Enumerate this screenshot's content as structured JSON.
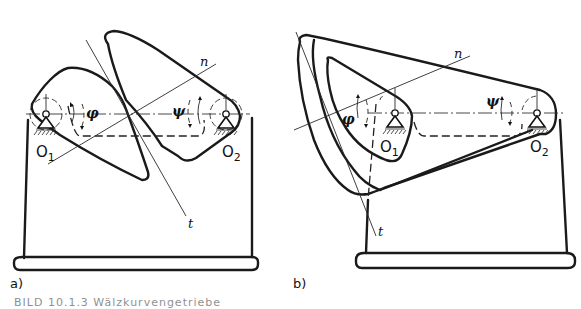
{
  "figure": {
    "panels": [
      {
        "id": "a",
        "label": "a)",
        "pivot_left": "O",
        "pivot_left_sub": "1",
        "pivot_right": "O",
        "pivot_right_sub": "2",
        "angle_left": "φ",
        "angle_right": "ψ",
        "normal_label": "n",
        "tangent_label": "t"
      },
      {
        "id": "b",
        "label": "b)",
        "pivot_left": "O",
        "pivot_left_sub": "1",
        "pivot_right": "O",
        "pivot_right_sub": "2",
        "angle_left": "φ",
        "angle_right": "ψ",
        "normal_label": "n",
        "tangent_label": "t"
      }
    ],
    "caption": "BILD 10.1.3  Wälzkurvengetriebe"
  }
}
